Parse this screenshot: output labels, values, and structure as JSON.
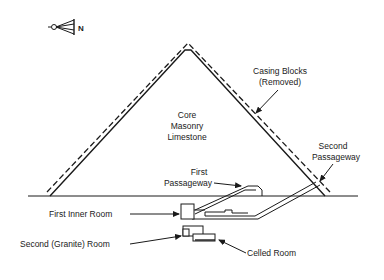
{
  "compass": {
    "icon": "north-arrow-icon",
    "label": "N"
  },
  "labels": {
    "core": [
      "Core",
      "Masonry",
      "Limestone"
    ],
    "casing": [
      "Casing Blocks",
      "(Removed)"
    ],
    "second_passage": [
      "Second",
      "Passageway"
    ],
    "first_passage": [
      "First",
      "Passageway"
    ],
    "first_inner_room": "First Inner Room",
    "second_room": "Second (Granite) Room",
    "celled_room": "Celled Room"
  },
  "colors": {
    "line": "#1a1a1a",
    "background": "#ffffff"
  }
}
